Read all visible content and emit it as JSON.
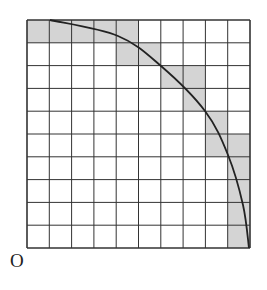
{
  "diagram": {
    "type": "grid-area-approximation",
    "grid": {
      "rows": 10,
      "cols": 10,
      "origin_px": [
        27,
        20
      ],
      "cell_w": 22.3,
      "cell_h": 22.8,
      "line_color": "#333333",
      "fill_color": "#d4d4d4",
      "bg_color": "#ffffff"
    },
    "shaded_cells": [
      [
        0,
        0
      ],
      [
        0,
        1
      ],
      [
        0,
        2
      ],
      [
        0,
        3
      ],
      [
        0,
        4
      ],
      [
        1,
        4
      ],
      [
        1,
        5
      ],
      [
        2,
        6
      ],
      [
        2,
        7
      ],
      [
        3,
        7
      ],
      [
        4,
        8
      ],
      [
        5,
        8
      ],
      [
        5,
        9
      ],
      [
        6,
        9
      ],
      [
        7,
        9
      ],
      [
        8,
        9
      ],
      [
        9,
        9
      ]
    ],
    "curve": {
      "description": "quarter-circle arc centered at lower-left corner O",
      "points": [
        [
          50,
          20
        ],
        [
          118,
          36
        ],
        [
          161,
          66
        ],
        [
          205,
          111
        ],
        [
          228,
          155
        ],
        [
          243,
          205
        ],
        [
          249,
          248
        ]
      ]
    },
    "origin_label": "O"
  }
}
